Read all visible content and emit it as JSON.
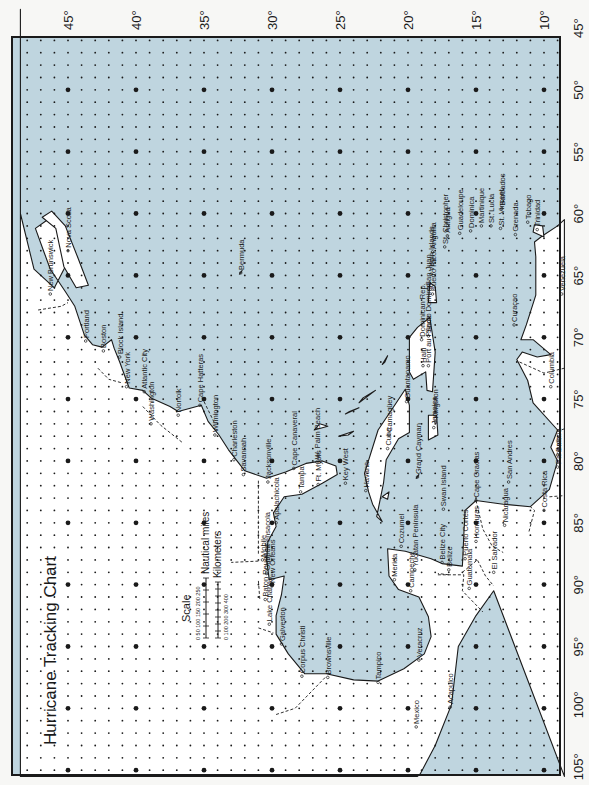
{
  "title": "Hurricane Tracking Chart",
  "colors": {
    "ocean": "#bfd5df",
    "land": "#ffffff",
    "frame": "#1a1a1a",
    "text": "#1a1a1a",
    "paper": "#f7f7f5"
  },
  "grid": {
    "latitudes": [
      45,
      40,
      35,
      30,
      25,
      20,
      15,
      10
    ],
    "longitudes": [
      45,
      50,
      55,
      60,
      65,
      70,
      75,
      80,
      85,
      90,
      95,
      100,
      105
    ],
    "lat_range": [
      8.5,
      48.5
    ],
    "lon_range": [
      43.5,
      105.5
    ],
    "minor_dot_step_deg": 1,
    "major_dot_step_deg": 5
  },
  "lat_labels": [
    "45°",
    "40°",
    "35°",
    "30°",
    "25°",
    "20°",
    "15°",
    "10°"
  ],
  "lon_labels": [
    "45°",
    "50°",
    "55°",
    "60°",
    "65°",
    "70°",
    "75°",
    "80°",
    "85°",
    "90°",
    "95°",
    "100°",
    "105°"
  ],
  "scale": {
    "title": "Scale",
    "nautical_ticks": "0  50 100 150 200 250",
    "nautical_label": "Nautical miles",
    "km_ticks": "0  100 200 300 400",
    "km_label": "Kilometers"
  },
  "places": [
    {
      "name": "New Brunswick",
      "lat": 46.3,
      "lon": 66.5
    },
    {
      "name": "Nova Scotia",
      "lat": 45.0,
      "lon": 63.0
    },
    {
      "name": "Portland",
      "lat": 43.7,
      "lon": 70.3
    },
    {
      "name": "Boston",
      "lat": 42.4,
      "lon": 71.1
    },
    {
      "name": "Block Island",
      "lat": 41.2,
      "lon": 71.6
    },
    {
      "name": "New York",
      "lat": 40.7,
      "lon": 74.0
    },
    {
      "name": "Atlantic City",
      "lat": 39.4,
      "lon": 74.4
    },
    {
      "name": "Washington",
      "lat": 38.9,
      "lon": 77.0
    },
    {
      "name": "Norfolk",
      "lat": 36.9,
      "lon": 76.3
    },
    {
      "name": "Cape Hatteras",
      "lat": 35.3,
      "lon": 75.5
    },
    {
      "name": "Wilmington",
      "lat": 34.2,
      "lon": 77.9
    },
    {
      "name": "Charleston",
      "lat": 32.8,
      "lon": 79.9
    },
    {
      "name": "Savannah",
      "lat": 32.1,
      "lon": 81.1
    },
    {
      "name": "Jacksonville",
      "lat": 30.3,
      "lon": 81.7
    },
    {
      "name": "Cape Canaveral",
      "lat": 28.4,
      "lon": 80.6
    },
    {
      "name": "W. Palm Beach",
      "lat": 26.7,
      "lon": 80.1
    },
    {
      "name": "Tampa",
      "lat": 27.9,
      "lon": 82.5
    },
    {
      "name": "Ft. Myers",
      "lat": 26.6,
      "lon": 81.9
    },
    {
      "name": "Key West",
      "lat": 24.6,
      "lon": 81.8
    },
    {
      "name": "Havana",
      "lat": 23.1,
      "lon": 82.4
    },
    {
      "name": "Pensacola",
      "lat": 30.4,
      "lon": 87.2
    },
    {
      "name": "Apalachicola",
      "lat": 29.7,
      "lon": 85.0
    },
    {
      "name": "Mobile",
      "lat": 30.7,
      "lon": 88.0
    },
    {
      "name": "Gulfport",
      "lat": 30.4,
      "lon": 89.1
    },
    {
      "name": "New Orleans",
      "lat": 30.0,
      "lon": 90.1
    },
    {
      "name": "Baton Rouge",
      "lat": 30.5,
      "lon": 91.2
    },
    {
      "name": "Lake Charles",
      "lat": 30.2,
      "lon": 93.2
    },
    {
      "name": "Galveston",
      "lat": 29.3,
      "lon": 94.8
    },
    {
      "name": "Corpus Christi",
      "lat": 27.8,
      "lon": 97.4
    },
    {
      "name": "Brownsville",
      "lat": 25.9,
      "lon": 97.5
    },
    {
      "name": "Tampico",
      "lat": 22.2,
      "lon": 97.9
    },
    {
      "name": "Mexico",
      "lat": 19.4,
      "lon": 101.5
    },
    {
      "name": "Veracruz",
      "lat": 19.2,
      "lon": 96.1
    },
    {
      "name": "Acapulco",
      "lat": 16.9,
      "lon": 99.9
    },
    {
      "name": "Campeche",
      "lat": 19.8,
      "lon": 90.5
    },
    {
      "name": "Merida",
      "lat": 21.0,
      "lon": 89.6
    },
    {
      "name": "Yucatan Peninsula",
      "lat": 19.5,
      "lon": 88.8
    },
    {
      "name": "Cozumel",
      "lat": 20.5,
      "lon": 86.9
    },
    {
      "name": "Grand Cayman",
      "lat": 19.3,
      "lon": 81.3
    },
    {
      "name": "Swan Island",
      "lat": 17.4,
      "lon": 83.9
    },
    {
      "name": "Belize City",
      "lat": 17.5,
      "lon": 88.2
    },
    {
      "name": "Belize",
      "lat": 17.0,
      "lon": 88.8
    },
    {
      "name": "Guatemala",
      "lat": 15.5,
      "lon": 90.3
    },
    {
      "name": "Puerto Cortés",
      "lat": 15.8,
      "lon": 87.9
    },
    {
      "name": "Honduras",
      "lat": 15.0,
      "lon": 86.5
    },
    {
      "name": "El Salvador",
      "lat": 13.7,
      "lon": 89.0
    },
    {
      "name": "Nicaragua",
      "lat": 12.9,
      "lon": 85.2
    },
    {
      "name": "Cape Gracias",
      "lat": 15.0,
      "lon": 83.2
    },
    {
      "name": "San Andres",
      "lat": 12.6,
      "lon": 81.7
    },
    {
      "name": "Costa Rica",
      "lat": 10.0,
      "lon": 84.0
    },
    {
      "name": "Panama",
      "lat": 9.0,
      "lon": 80.5
    },
    {
      "name": "Balboa",
      "lat": 9.0,
      "lon": 79.5
    },
    {
      "name": "Columbia",
      "lat": 9.5,
      "lon": 74.0
    },
    {
      "name": "Cuba",
      "lat": 21.5,
      "lon": 79.0
    },
    {
      "name": "Camagüey",
      "lat": 21.4,
      "lon": 77.9
    },
    {
      "name": "Guantanamo",
      "lat": 20.1,
      "lon": 75.2
    },
    {
      "name": "Jamaica",
      "lat": 18.1,
      "lon": 77.3
    },
    {
      "name": "Kingston",
      "lat": 18.0,
      "lon": 76.8
    },
    {
      "name": "Haiti",
      "lat": 18.9,
      "lon": 72.3
    },
    {
      "name": "Port au Prince",
      "lat": 18.5,
      "lon": 72.3
    },
    {
      "name": "Dominican Rep.",
      "lat": 19.0,
      "lon": 70.2
    },
    {
      "name": "Santo Domingo",
      "lat": 18.5,
      "lon": 69.9
    },
    {
      "name": "San Juan",
      "lat": 18.5,
      "lon": 66.1
    },
    {
      "name": "Puerto Rico",
      "lat": 18.2,
      "lon": 66.5
    },
    {
      "name": "Virgin Islands",
      "lat": 18.3,
      "lon": 64.9
    },
    {
      "name": "Anguilla",
      "lat": 18.2,
      "lon": 63.1
    },
    {
      "name": "St. Christopher",
      "lat": 17.3,
      "lon": 62.7
    },
    {
      "name": "Antigua",
      "lat": 17.1,
      "lon": 61.8
    },
    {
      "name": "Guadeloupe",
      "lat": 16.2,
      "lon": 61.6
    },
    {
      "name": "Dominica",
      "lat": 15.4,
      "lon": 61.4
    },
    {
      "name": "Martinique",
      "lat": 14.6,
      "lon": 61.0
    },
    {
      "name": "St. Lucia",
      "lat": 13.9,
      "lon": 61.0
    },
    {
      "name": "St. Vincent",
      "lat": 13.2,
      "lon": 61.2
    },
    {
      "name": "Barbados",
      "lat": 13.1,
      "lon": 59.6
    },
    {
      "name": "Grenada",
      "lat": 12.1,
      "lon": 61.7
    },
    {
      "name": "Trinidad",
      "lat": 10.5,
      "lon": 61.3
    },
    {
      "name": "Tobago",
      "lat": 11.2,
      "lon": 60.7
    },
    {
      "name": "Curaçao",
      "lat": 12.2,
      "lon": 69.0
    },
    {
      "name": "Venezuela",
      "lat": 8.7,
      "lon": 66.5
    },
    {
      "name": "Bermuda",
      "lat": 32.3,
      "lon": 64.8
    }
  ]
}
